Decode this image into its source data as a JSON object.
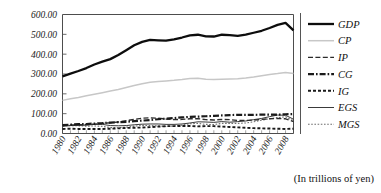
{
  "caption": {
    "unit_note": "(In trillions of yen)"
  },
  "chart_data": {
    "type": "line",
    "title": "",
    "subtitle": "",
    "xlabel": "",
    "ylabel": "",
    "unit_note": "(In trillions of yen)",
    "grid": false,
    "legend_position": "right",
    "xlim": [
      1980,
      2009
    ],
    "ylim": [
      0,
      600
    ],
    "yticks": [
      0,
      100,
      200,
      300,
      400,
      500,
      600
    ],
    "ytick_labels": [
      "0.00",
      "100.00",
      "200.00",
      "300.00",
      "400.00",
      "500.00",
      "600.00"
    ],
    "xticks": [
      1980,
      1982,
      1984,
      1986,
      1988,
      1990,
      1992,
      1994,
      1996,
      1998,
      2000,
      2002,
      2004,
      2006,
      2008
    ],
    "xtick_labels": [
      "1980",
      "1982",
      "1984",
      "1986",
      "1988",
      "1990",
      "1992",
      "1994",
      "1996",
      "1998",
      "2000",
      "2002",
      "2004",
      "2006",
      "2008"
    ],
    "x": [
      1980,
      1981,
      1982,
      1983,
      1984,
      1985,
      1986,
      1987,
      1988,
      1989,
      1990,
      1991,
      1992,
      1993,
      1994,
      1995,
      1996,
      1997,
      1998,
      1999,
      2000,
      2001,
      2002,
      2003,
      2004,
      2005,
      2006,
      2007,
      2008,
      2009
    ],
    "series": [
      {
        "name": "GDP",
        "style": "solid-thick",
        "color": "#0d0d0d",
        "values": [
          288,
          302,
          315,
          330,
          348,
          362,
          375,
          396,
          420,
          445,
          462,
          472,
          470,
          468,
          475,
          484,
          495,
          498,
          490,
          489,
          498,
          496,
          492,
          498,
          508,
          518,
          532,
          548,
          558,
          520
        ]
      },
      {
        "name": "CP",
        "style": "solid-thin-gray",
        "color": "#c7c7c7",
        "values": [
          167,
          175,
          182,
          190,
          198,
          206,
          214,
          222,
          232,
          242,
          251,
          258,
          262,
          265,
          268,
          272,
          277,
          278,
          274,
          272,
          274,
          275,
          276,
          280,
          285,
          291,
          297,
          302,
          308,
          302
        ]
      },
      {
        "name": "IP",
        "style": "dashed-thin",
        "color": "#2b2b2b",
        "values": [
          41,
          43,
          44,
          45,
          47,
          51,
          54,
          58,
          65,
          71,
          77,
          79,
          77,
          73,
          70,
          71,
          74,
          75,
          70,
          68,
          71,
          70,
          66,
          66,
          68,
          71,
          74,
          76,
          74,
          60
        ]
      },
      {
        "name": "CG",
        "style": "dash-dot-thick",
        "color": "#1a1a1a",
        "values": [
          42,
          45,
          47,
          48,
          50,
          52,
          55,
          57,
          59,
          62,
          65,
          68,
          72,
          75,
          78,
          81,
          84,
          85,
          87,
          89,
          91,
          93,
          94,
          94,
          94,
          95,
          95,
          95,
          97,
          98
        ]
      },
      {
        "name": "IG",
        "style": "dashed-thick-short",
        "color": "#1a1a1a",
        "values": [
          23,
          24,
          23,
          23,
          23,
          23,
          24,
          26,
          28,
          29,
          30,
          32,
          35,
          37,
          37,
          38,
          38,
          36,
          37,
          37,
          35,
          33,
          31,
          29,
          27,
          26,
          25,
          24,
          23,
          24
        ]
      },
      {
        "name": "EGS",
        "style": "solid-thin",
        "color": "#3a3a3a",
        "values": [
          36,
          40,
          41,
          42,
          46,
          46,
          40,
          39,
          40,
          44,
          47,
          48,
          48,
          46,
          46,
          48,
          53,
          59,
          58,
          56,
          60,
          57,
          60,
          63,
          70,
          76,
          85,
          93,
          92,
          72
        ]
      },
      {
        "name": "MGS",
        "style": "dotted",
        "color": "#6e6e6e",
        "values": [
          38,
          40,
          39,
          37,
          38,
          36,
          30,
          29,
          32,
          37,
          41,
          40,
          38,
          36,
          38,
          42,
          49,
          51,
          46,
          45,
          51,
          51,
          51,
          53,
          59,
          67,
          75,
          80,
          84,
          64
        ]
      }
    ]
  },
  "legend": {
    "entries": [
      {
        "label": "GDP"
      },
      {
        "label": "CP"
      },
      {
        "label": "IP"
      },
      {
        "label": "CG"
      },
      {
        "label": "IG"
      },
      {
        "label": "EGS"
      },
      {
        "label": "MGS"
      }
    ]
  }
}
